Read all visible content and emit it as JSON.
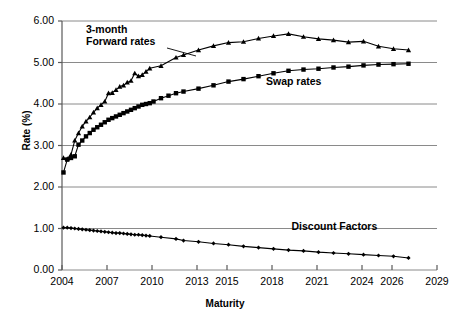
{
  "chart_data": {
    "type": "line",
    "title": "",
    "xlabel": "Maturity",
    "ylabel": "Rate (%)",
    "xlim": [
      2004,
      2029
    ],
    "ylim": [
      0.0,
      6.0
    ],
    "grid": true,
    "legend_position": "inline-annotations",
    "ytick_labels": [
      "0.00",
      "1.00",
      "2.00",
      "3.00",
      "4.00",
      "5.00",
      "6.00"
    ],
    "ytick_values": [
      0.0,
      1.0,
      2.0,
      3.0,
      4.0,
      5.0,
      6.0
    ],
    "xtick_labels": [
      "2004",
      "2007",
      "2010",
      "2013",
      "2015",
      "2018",
      "2021",
      "2024",
      "2026",
      "2029"
    ],
    "xtick_values": [
      2004,
      2007,
      2010,
      2013,
      2015,
      2018,
      2021,
      2024,
      2026,
      2029
    ],
    "annotations": [
      {
        "text": "3-month\nForward rates",
        "x": 2005.6,
        "y": 5.78
      },
      {
        "text": "Swap rates",
        "x": 2017.6,
        "y": 4.52
      },
      {
        "text": "Discount Factors",
        "x": 2019.3,
        "y": 1.03
      }
    ],
    "series": [
      {
        "name": "3-month Forward rates",
        "marker": "triangle",
        "color": "#000000",
        "x": [
          2004.1,
          2004.35,
          2004.6,
          2004.85,
          2005.1,
          2005.35,
          2005.6,
          2005.85,
          2006.1,
          2006.35,
          2006.6,
          2006.85,
          2007.1,
          2007.35,
          2007.6,
          2007.85,
          2008.1,
          2008.35,
          2008.6,
          2008.85,
          2009.1,
          2009.35,
          2009.6,
          2009.85,
          2010.6,
          2011.6,
          2012.1,
          2013.1,
          2014.1,
          2015.1,
          2016.1,
          2017.1,
          2018.1,
          2019.1,
          2020.1,
          2021.1,
          2022.1,
          2023.1,
          2024.1,
          2025.1,
          2026.1,
          2027.1
        ],
        "y": [
          2.7,
          2.68,
          2.78,
          3.12,
          3.3,
          3.46,
          3.58,
          3.68,
          3.8,
          3.9,
          3.98,
          4.06,
          4.26,
          4.27,
          4.34,
          4.42,
          4.45,
          4.52,
          4.56,
          4.74,
          4.67,
          4.7,
          4.78,
          4.86,
          4.92,
          5.12,
          5.18,
          5.3,
          5.4,
          5.48,
          5.5,
          5.58,
          5.64,
          5.69,
          5.62,
          5.57,
          5.54,
          5.49,
          5.51,
          5.39,
          5.33,
          5.3
        ]
      },
      {
        "name": "Swap rates",
        "marker": "square",
        "color": "#000000",
        "x": [
          2004.1,
          2004.35,
          2004.6,
          2004.85,
          2005.1,
          2005.35,
          2005.6,
          2005.85,
          2006.1,
          2006.35,
          2006.6,
          2006.85,
          2007.1,
          2007.35,
          2007.6,
          2007.85,
          2008.1,
          2008.35,
          2008.6,
          2008.85,
          2009.1,
          2009.35,
          2009.6,
          2009.85,
          2010.1,
          2010.6,
          2011.1,
          2011.6,
          2012.1,
          2013.1,
          2014.1,
          2015.1,
          2016.1,
          2017.1,
          2018.1,
          2019.1,
          2020.1,
          2021.1,
          2022.1,
          2023.1,
          2024.1,
          2025.1,
          2026.1,
          2027.1
        ],
        "y": [
          2.35,
          2.66,
          2.7,
          2.74,
          3.02,
          3.12,
          3.22,
          3.3,
          3.38,
          3.44,
          3.5,
          3.56,
          3.62,
          3.66,
          3.7,
          3.74,
          3.78,
          3.82,
          3.86,
          3.9,
          3.94,
          3.98,
          4.0,
          4.02,
          4.06,
          4.14,
          4.2,
          4.26,
          4.3,
          4.37,
          4.45,
          4.54,
          4.6,
          4.67,
          4.74,
          4.8,
          4.83,
          4.85,
          4.88,
          4.9,
          4.93,
          4.95,
          4.96,
          4.97
        ]
      },
      {
        "name": "Discount Factors",
        "marker": "diamond",
        "color": "#000000",
        "x": [
          2004.1,
          2004.35,
          2004.6,
          2004.85,
          2005.1,
          2005.35,
          2005.6,
          2005.85,
          2006.1,
          2006.35,
          2006.6,
          2006.85,
          2007.1,
          2007.35,
          2007.6,
          2007.85,
          2008.1,
          2008.35,
          2008.6,
          2008.85,
          2009.1,
          2009.35,
          2009.6,
          2009.85,
          2010.6,
          2011.6,
          2012.1,
          2013.1,
          2014.1,
          2015.1,
          2016.1,
          2017.1,
          2018.1,
          2019.1,
          2020.1,
          2021.1,
          2022.1,
          2023.1,
          2024.1,
          2025.1,
          2026.1,
          2027.1
        ],
        "y": [
          1.02,
          1.02,
          1.01,
          1.0,
          0.99,
          0.98,
          0.97,
          0.96,
          0.95,
          0.94,
          0.93,
          0.92,
          0.91,
          0.9,
          0.89,
          0.89,
          0.88,
          0.87,
          0.86,
          0.85,
          0.85,
          0.84,
          0.83,
          0.82,
          0.79,
          0.75,
          0.71,
          0.68,
          0.64,
          0.61,
          0.57,
          0.54,
          0.51,
          0.48,
          0.46,
          0.43,
          0.41,
          0.39,
          0.37,
          0.35,
          0.33,
          0.29
        ]
      }
    ]
  }
}
